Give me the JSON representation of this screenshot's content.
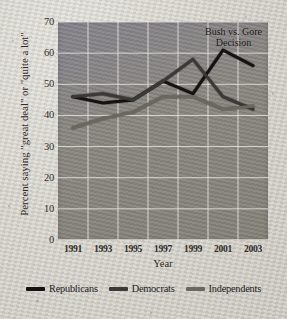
{
  "chart_data": {
    "type": "line",
    "title": "",
    "xlabel": "Year",
    "ylabel": "Percent saying \"great deal\" or \"quite a lot\"",
    "x": [
      1991,
      1993,
      1995,
      1997,
      1999,
      2001,
      2003
    ],
    "xticklabels": [
      "1991",
      "1993",
      "1995",
      "1997",
      "1999",
      "2001",
      "2003"
    ],
    "yticklabels": [
      "0",
      "10",
      "20",
      "30",
      "40",
      "50",
      "60",
      "70"
    ],
    "ylim": [
      0,
      70
    ],
    "ytick_step": 10,
    "grid": true,
    "legend_position": "below",
    "annotations": [
      {
        "text_line1": "Bush vs. Gore",
        "text_line2": "Decision",
        "at_x": 2001
      }
    ],
    "series": [
      {
        "name": "Republicans",
        "color": "#141312",
        "values": [
          46,
          44,
          45,
          51,
          47,
          61,
          56
        ]
      },
      {
        "name": "Democrats",
        "color": "#3b3935",
        "values": [
          46,
          47,
          45,
          51,
          58,
          46,
          42
        ]
      },
      {
        "name": "Independents",
        "color": "#6b675f",
        "values": [
          36,
          39,
          41,
          46,
          46,
          42,
          43
        ]
      }
    ]
  },
  "legend": {
    "items": [
      {
        "label": "Republicans"
      },
      {
        "label": "Democrats"
      },
      {
        "label": "Independents"
      }
    ]
  }
}
